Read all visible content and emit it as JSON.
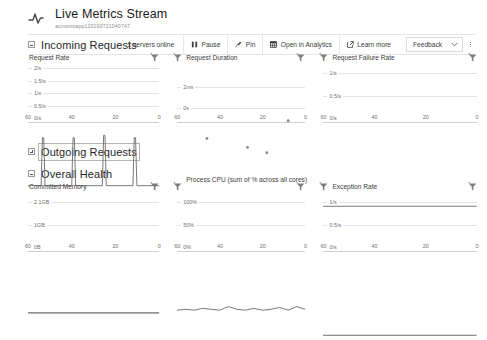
{
  "header": {
    "icon": "pulse-icon",
    "title": "Live Metrics Stream",
    "subtitle": "acmonixapp120190721040747"
  },
  "toolbar": {
    "status": "1 servers online",
    "pause_label": "Pause",
    "pin_label": "Pin",
    "analytics_label": "Open in Analytics",
    "learn_more_label": "Learn more",
    "feedback_label": "Feedback"
  },
  "sections": [
    {
      "key": "incoming",
      "label": "Incoming Requests",
      "collapsed": false,
      "focused": false
    },
    {
      "key": "outgoing",
      "label": "Outgoing Requests",
      "collapsed": true,
      "focused": true
    },
    {
      "key": "overall",
      "label": "Overall Health",
      "collapsed": false,
      "focused": false
    }
  ],
  "chart_data": [
    {
      "id": "request-rate",
      "type": "line",
      "title": "Request Rate",
      "xlabel": "",
      "ylabel": "",
      "yticks": [
        "0/s",
        "0.5/s",
        "1/s",
        "1.5/s",
        "2/s"
      ],
      "ylim": [
        0,
        2.35
      ],
      "xticks": [
        "60",
        "40",
        "20",
        "0"
      ],
      "xlim": [
        60,
        0
      ],
      "grid": true,
      "x": [
        60,
        54,
        53.4,
        52.8,
        52.2,
        40,
        39.4,
        38.8,
        38.2,
        26,
        25.4,
        24.8,
        24.2,
        12,
        11.4,
        10.8,
        10.2,
        0
      ],
      "values": [
        0,
        0,
        1.0,
        1.0,
        0,
        0,
        1.0,
        1.0,
        0,
        0,
        1.05,
        1.05,
        0,
        0,
        1.0,
        1.0,
        0,
        0
      ]
    },
    {
      "id": "request-duration",
      "type": "scatter",
      "title": "Request Duration",
      "xlabel": "",
      "ylabel": "",
      "yticks": [
        "0s",
        "2ms"
      ],
      "ylim": [
        0,
        3.1
      ],
      "xticks": [
        "60",
        "40",
        "20",
        "0"
      ],
      "xlim": [
        60,
        0
      ],
      "grid": true,
      "x": [
        46,
        27,
        18,
        8
      ],
      "values": [
        1.25,
        1.0,
        0.85,
        1.75
      ]
    },
    {
      "id": "request-failure-rate",
      "type": "line",
      "title": "Request Failure Rate",
      "xlabel": "",
      "ylabel": "",
      "yticks": [
        "0/s",
        "0.5/s",
        "1/s"
      ],
      "ylim": [
        0,
        1.25
      ],
      "xticks": [
        "60",
        "40",
        "20",
        "0"
      ],
      "xlim": [
        60,
        0
      ],
      "grid": true,
      "x": [
        60,
        0
      ],
      "values": [
        0,
        0
      ]
    },
    {
      "id": "committed-memory",
      "type": "line",
      "title": "Committed Memory",
      "xlabel": "",
      "ylabel": "",
      "yticks": [
        "0B",
        "1GB",
        "2.1GB"
      ],
      "ylim": [
        0,
        2.45
      ],
      "xticks": [
        "60",
        "40",
        "20",
        "0"
      ],
      "xlim": [
        60,
        0
      ],
      "grid": true,
      "x": [
        60,
        0
      ],
      "values": [
        0.04,
        0.04
      ]
    },
    {
      "id": "process-cpu",
      "type": "line",
      "title": "Process CPU (sum of % across all cores)",
      "xlabel": "",
      "ylabel": "",
      "yticks": [
        "0%",
        "50%",
        "100%"
      ],
      "ylim": [
        0,
        122
      ],
      "xticks": [
        "60",
        "40",
        "20",
        "0"
      ],
      "xlim": [
        60,
        0
      ],
      "grid": true,
      "x": [
        60,
        56,
        52,
        48,
        44,
        40,
        36,
        32,
        28,
        24,
        20,
        16,
        12,
        8,
        4,
        0
      ],
      "values": [
        2,
        3,
        2,
        4,
        3,
        2,
        6,
        3,
        2,
        4,
        2,
        3,
        5,
        2,
        6,
        3
      ]
    },
    {
      "id": "exception-rate",
      "type": "line",
      "title": "Exception Rate",
      "xlabel": "",
      "ylabel": "",
      "yticks": [
        "0/s",
        "0.5/s",
        "1/s"
      ],
      "ylim": [
        0,
        1.25
      ],
      "xticks": [
        "60",
        "40",
        "20",
        "0"
      ],
      "xlim": [
        60,
        0
      ],
      "grid": true,
      "x": [
        60,
        0
      ],
      "values": [
        0,
        0
      ]
    }
  ]
}
